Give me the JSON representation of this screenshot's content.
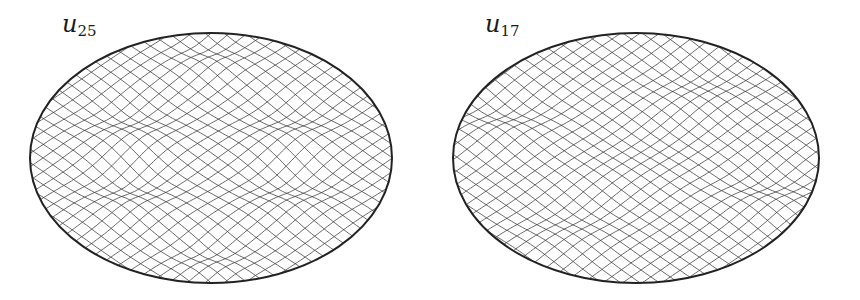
{
  "figure": {
    "width": 860,
    "height": 300,
    "line_color": "#3a3a3a",
    "boundary_color": "#222222",
    "panels": [
      {
        "id": "u25",
        "label_base": "u",
        "label_sub": "25",
        "label_x": 62,
        "label_y": 12,
        "cx": 211,
        "cy": 158,
        "rx": 181,
        "ry": 125,
        "grid_spacing": 11,
        "bumps": [
          {
            "x": 0.0,
            "y": -0.82,
            "s": 0.16,
            "a": 1.0
          },
          {
            "x": 0.0,
            "y": 0.82,
            "s": 0.16,
            "a": 1.0
          },
          {
            "x": -0.45,
            "y": -0.25,
            "s": 0.2,
            "a": 1.0
          },
          {
            "x": 0.45,
            "y": -0.25,
            "s": 0.2,
            "a": 1.0
          },
          {
            "x": -0.45,
            "y": 0.3,
            "s": 0.2,
            "a": 1.0
          },
          {
            "x": 0.45,
            "y": 0.3,
            "s": 0.2,
            "a": 1.0
          }
        ]
      },
      {
        "id": "u17",
        "label_base": "u",
        "label_sub": "17",
        "label_x": 485,
        "label_y": 12,
        "cx": 636,
        "cy": 158,
        "rx": 183,
        "ry": 125,
        "grid_spacing": 11,
        "bumps": [
          {
            "x": -0.72,
            "y": -0.3,
            "s": 0.2,
            "a": 1.0
          },
          {
            "x": 0.72,
            "y": 0.28,
            "s": 0.2,
            "a": 1.0
          },
          {
            "x": -0.35,
            "y": 0.55,
            "s": 0.22,
            "a": 0.7
          },
          {
            "x": 0.35,
            "y": -0.55,
            "s": 0.22,
            "a": 0.7
          },
          {
            "x": 0.0,
            "y": 0.0,
            "s": 0.3,
            "a": 0.3
          }
        ]
      }
    ]
  }
}
